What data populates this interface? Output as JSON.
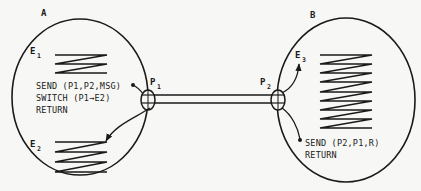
{
  "diagram": {
    "type": "process-communication",
    "colors": {
      "ink": "#1a1a1a",
      "background": "#f7f7f5"
    },
    "processes": [
      {
        "id": "A",
        "label": "A",
        "entries": [
          {
            "id": "E1",
            "label": "E",
            "sub": "1"
          },
          {
            "id": "E2",
            "label": "E",
            "sub": "2"
          }
        ],
        "code": [
          "SEND (P1,P2,MSG)",
          "SWITCH (P1→E2)",
          "RETURN"
        ],
        "port": {
          "label": "P",
          "sub": "1"
        }
      },
      {
        "id": "B",
        "label": "B",
        "entries": [
          {
            "id": "E3",
            "label": "E",
            "sub": "3"
          }
        ],
        "code": [
          "SEND (P2,P1,R)",
          "RETURN"
        ],
        "port": {
          "label": "P",
          "sub": "2"
        }
      }
    ],
    "edges": [
      {
        "from": "P1",
        "to": "P2",
        "kind": "channel"
      },
      {
        "from": "SEND (P1,P2,MSG)",
        "to": "P1",
        "kind": "link"
      },
      {
        "from": "P1",
        "to": "E2",
        "kind": "arrow"
      },
      {
        "from": "P2",
        "to": "E3",
        "kind": "arrow"
      },
      {
        "from": "P2",
        "to": "SEND (P2,P1,R)",
        "kind": "link"
      }
    ]
  }
}
